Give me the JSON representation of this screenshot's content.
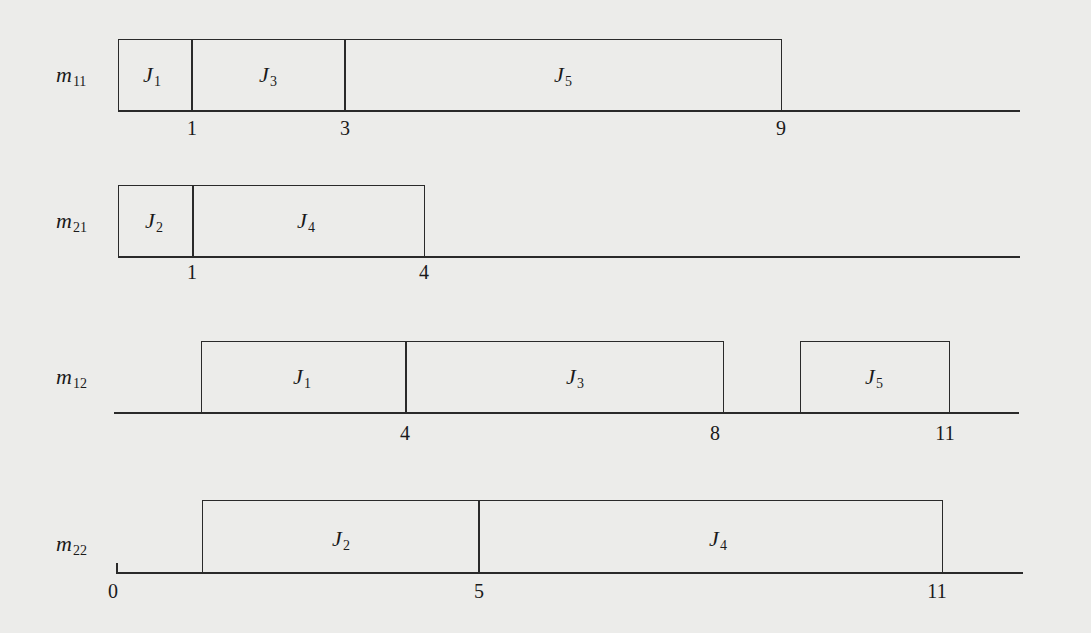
{
  "diagram": {
    "type": "gantt-schedule",
    "time_origin_label": "0",
    "machines": [
      {
        "id": "m11",
        "symbol": "m",
        "subscript": "11",
        "jobs": [
          {
            "symbol": "J",
            "subscript": "1",
            "start": 0,
            "end": 1
          },
          {
            "symbol": "J",
            "subscript": "3",
            "start": 1,
            "end": 3
          },
          {
            "symbol": "J",
            "subscript": "5",
            "start": 3,
            "end": 9
          }
        ],
        "tick_labels": [
          "1",
          "3",
          "9"
        ]
      },
      {
        "id": "m21",
        "symbol": "m",
        "subscript": "21",
        "jobs": [
          {
            "symbol": "J",
            "subscript": "2",
            "start": 0,
            "end": 1
          },
          {
            "symbol": "J",
            "subscript": "4",
            "start": 1,
            "end": 4
          }
        ],
        "tick_labels": [
          "1",
          "4"
        ]
      },
      {
        "id": "m12",
        "symbol": "m",
        "subscript": "12",
        "jobs": [
          {
            "symbol": "J",
            "subscript": "1",
            "start": 1,
            "end": 4
          },
          {
            "symbol": "J",
            "subscript": "3",
            "start": 4,
            "end": 8
          },
          {
            "symbol": "J",
            "subscript": "5",
            "start": 9,
            "end": 11
          }
        ],
        "tick_labels": [
          "4",
          "8",
          "11"
        ]
      },
      {
        "id": "m22",
        "symbol": "m",
        "subscript": "22",
        "jobs": [
          {
            "symbol": "J",
            "subscript": "2",
            "start": 1,
            "end": 5
          },
          {
            "symbol": "J",
            "subscript": "4",
            "start": 5,
            "end": 11
          }
        ],
        "tick_labels": [
          "0",
          "5",
          "11"
        ]
      }
    ]
  }
}
